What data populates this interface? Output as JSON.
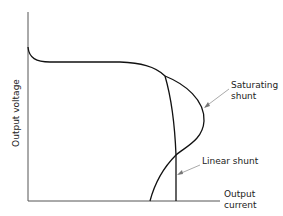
{
  "axes": {
    "y_label": "Output voltage",
    "x_label_line1": "Output",
    "x_label_line2": "current"
  },
  "annotations": {
    "saturating_line1": "Saturating",
    "saturating_line2": "shunt",
    "linear": "Linear shunt"
  },
  "colors": {
    "line": "#111111",
    "axis": "#333333",
    "arrow": "#999999"
  }
}
